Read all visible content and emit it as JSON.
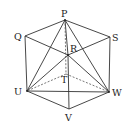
{
  "diagram": {
    "type": "cube-isometric",
    "points": {
      "P": {
        "x": 65,
        "y": 20,
        "label": "P",
        "lx": 61,
        "ly": 17
      },
      "Q": {
        "x": 25,
        "y": 36,
        "label": "Q",
        "lx": 14,
        "ly": 40
      },
      "S": {
        "x": 110,
        "y": 37,
        "label": "S",
        "lx": 112,
        "ly": 41
      },
      "R": {
        "x": 68,
        "y": 55,
        "label": "R",
        "lx": 70,
        "ly": 52
      },
      "T": {
        "x": 66,
        "y": 74,
        "label": "T",
        "lx": 61,
        "ly": 83
      },
      "U": {
        "x": 27,
        "y": 91,
        "label": "U",
        "lx": 14,
        "ly": 95
      },
      "W": {
        "x": 109,
        "y": 92,
        "label": "W",
        "lx": 112,
        "ly": 96
      },
      "V": {
        "x": 69,
        "y": 109,
        "label": "V",
        "lx": 65,
        "ly": 121
      }
    },
    "solid_edges": [
      [
        "P",
        "Q"
      ],
      [
        "Q",
        "U"
      ],
      [
        "U",
        "V"
      ],
      [
        "V",
        "W"
      ],
      [
        "W",
        "S"
      ],
      [
        "S",
        "P"
      ],
      [
        "Q",
        "R"
      ],
      [
        "R",
        "S"
      ],
      [
        "R",
        "V"
      ],
      [
        "P",
        "U"
      ],
      [
        "P",
        "W"
      ],
      [
        "P",
        "R"
      ],
      [
        "R",
        "U"
      ],
      [
        "R",
        "W"
      ],
      [
        "U",
        "W"
      ]
    ],
    "dashed_edges": [
      [
        "P",
        "T"
      ],
      [
        "T",
        "U"
      ],
      [
        "T",
        "W"
      ]
    ]
  }
}
